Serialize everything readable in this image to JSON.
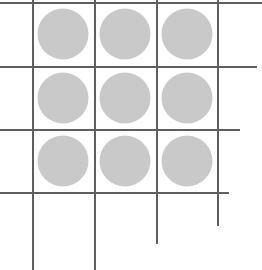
{
  "diagram": {
    "type": "grid-of-dots",
    "rows": 3,
    "cols": 3,
    "line_color": "#5f5f5f",
    "dot_color": "#c9c9c9",
    "line_width": 2,
    "dot_radius": 25.5,
    "vertical_lines": [
      {
        "x": 33,
        "y1": 0,
        "y2": 270
      },
      {
        "x": 95,
        "y1": 0,
        "y2": 270
      },
      {
        "x": 157,
        "y1": 0,
        "y2": 244
      },
      {
        "x": 218,
        "y1": 0,
        "y2": 226
      }
    ],
    "horizontal_lines": [
      {
        "y": 3,
        "x1": 0,
        "x2": 262
      },
      {
        "y": 67,
        "x1": 0,
        "x2": 257
      },
      {
        "y": 130,
        "x1": 0,
        "x2": 240
      },
      {
        "y": 193,
        "x1": 0,
        "x2": 229
      }
    ],
    "dots": [
      {
        "cx": 63,
        "cy": 34
      },
      {
        "cx": 125,
        "cy": 34
      },
      {
        "cx": 187,
        "cy": 34
      },
      {
        "cx": 63,
        "cy": 98
      },
      {
        "cx": 125,
        "cy": 98
      },
      {
        "cx": 187,
        "cy": 98
      },
      {
        "cx": 63,
        "cy": 161
      },
      {
        "cx": 125,
        "cy": 161
      },
      {
        "cx": 187,
        "cy": 161
      }
    ]
  }
}
